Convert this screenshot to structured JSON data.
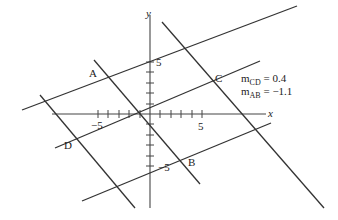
{
  "diagram": {
    "axes": {
      "x_label": "x",
      "y_label": "y",
      "x_tick_labels": {
        "pos": "5",
        "neg": "−5"
      },
      "y_tick_labels": {
        "pos": "5",
        "neg": "−5"
      }
    },
    "points": {
      "A": "A",
      "B": "B",
      "C": "C",
      "D": "D"
    },
    "annotations": {
      "m_cd_base": "m",
      "m_cd_sub": "CD",
      "m_cd_value": " = 0.4",
      "m_ab_base": "m",
      "m_ab_sub": "AB",
      "m_ab_value": " = −1.1"
    },
    "colors": {
      "line": "#333333",
      "text": "#222222",
      "background": "#ffffff"
    }
  }
}
